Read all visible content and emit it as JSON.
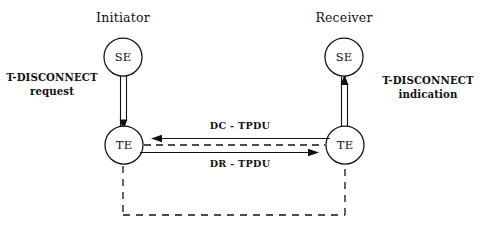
{
  "diagram": {
    "title_left": "Initiator",
    "title_right": "Receiver",
    "nodes": {
      "initiator_se": "SE",
      "initiator_te": "TE",
      "receiver_se": "SE",
      "receiver_te": "TE"
    },
    "service_primitives": {
      "left_line1": "T-DISCONNECT",
      "left_line2": "request",
      "right_line1": "T-DISCONNECT",
      "right_line2": "indication"
    },
    "messages": {
      "upper": "DC - TPDU",
      "lower": "DR - TPDU"
    },
    "colors": {
      "stroke": "#111111",
      "background": "#ffffff",
      "text": "#111111"
    },
    "geometry": {
      "se_left_cx": 123,
      "se_left_cy": 57,
      "se_right_cx": 344,
      "se_right_cy": 57,
      "te_left_cx": 124,
      "te_left_cy": 145,
      "te_right_cx": 345,
      "te_right_cy": 145,
      "circle_r": 19
    }
  }
}
